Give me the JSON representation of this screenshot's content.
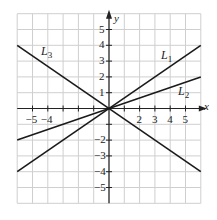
{
  "chart_data": {
    "type": "line",
    "title": "",
    "xlabel": "x",
    "ylabel": "y",
    "xlim": [
      -6,
      6
    ],
    "ylim": [
      -6,
      6
    ],
    "grid": true,
    "x_ticks": [
      -5,
      -4,
      2,
      3,
      4,
      5
    ],
    "y_ticks": [
      5,
      4,
      3,
      2,
      1,
      -2,
      -3,
      -4,
      -5
    ],
    "series": [
      {
        "name": "L1",
        "label_sub": "1",
        "slope": 0.6667,
        "intercept": 0,
        "points": [
          [
            -6,
            -4
          ],
          [
            6,
            4
          ]
        ]
      },
      {
        "name": "L2",
        "label_sub": "2",
        "slope": 0.3333,
        "intercept": 0,
        "points": [
          [
            -6,
            -2
          ],
          [
            6,
            2
          ]
        ]
      },
      {
        "name": "L3",
        "label_sub": "3",
        "slope": -0.6667,
        "intercept": 0,
        "points": [
          [
            -6,
            4
          ],
          [
            6,
            -4
          ]
        ]
      }
    ]
  },
  "labels": {
    "x_axis": "x",
    "y_axis": "y",
    "L1": {
      "main": "L",
      "sub": "1"
    },
    "L2": {
      "main": "L",
      "sub": "2"
    },
    "L3": {
      "main": "L",
      "sub": "3"
    }
  },
  "colors": {
    "grid": "#cfcfcf",
    "axis": "#222222",
    "line": "#1a1a1a"
  }
}
